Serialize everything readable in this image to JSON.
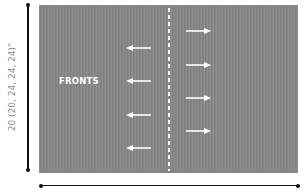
{
  "diagram": {
    "panel_label": "FRONTS",
    "height_dimension_label": "20 (20, 24, 24, 24)\"",
    "width_dimension_label": "",
    "colors": {
      "panel": "#868686",
      "arrows": "#ffffff",
      "center_dashed_line": "#ffffff",
      "dimension_lines": "#111111",
      "dimension_text": "#8a8a8a"
    },
    "left_arrows": [
      {
        "direction": "left",
        "icon": "arrow-left-icon"
      },
      {
        "direction": "left",
        "icon": "arrow-left-icon"
      },
      {
        "direction": "left",
        "icon": "arrow-left-icon"
      },
      {
        "direction": "left",
        "icon": "arrow-left-icon"
      }
    ],
    "right_arrows": [
      {
        "direction": "right",
        "icon": "arrow-right-icon"
      },
      {
        "direction": "right",
        "icon": "arrow-right-icon"
      },
      {
        "direction": "right",
        "icon": "arrow-right-icon"
      },
      {
        "direction": "right",
        "icon": "arrow-right-icon"
      }
    ]
  }
}
